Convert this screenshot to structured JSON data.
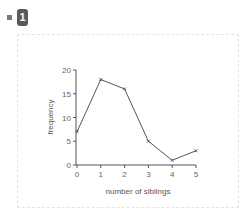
{
  "header": {
    "badge_number": "1"
  },
  "chart_data": {
    "type": "line",
    "title": "",
    "xlabel": "number of siblings",
    "ylabel": "frequency",
    "x": [
      0,
      1,
      2,
      3,
      4,
      5
    ],
    "values": [
      7,
      18,
      16,
      5,
      1,
      3
    ],
    "xlim": [
      0,
      5
    ],
    "ylim": [
      0,
      20
    ],
    "xticks": [
      "0",
      "1",
      "2",
      "3",
      "4",
      "5"
    ],
    "yticks": [
      "0",
      "5",
      "10",
      "15",
      "20"
    ],
    "grid": false,
    "legend": null,
    "line_color": "#555555"
  }
}
